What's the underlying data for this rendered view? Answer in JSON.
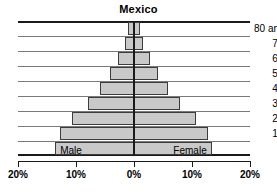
{
  "chart_data": {
    "type": "bar",
    "title": "Mexico",
    "subtitle": "",
    "xlabel": "",
    "ylabel": "",
    "orientation": "population-pyramid",
    "grid": true,
    "legend_position": "in-bars",
    "xlim": [
      -20,
      20
    ],
    "xticks": [
      -20,
      -10,
      0,
      10,
      20
    ],
    "xtick_labels": [
      "20%",
      "10%",
      "0%",
      "10%",
      "20%"
    ],
    "categories": [
      "80 and older",
      "70–79",
      "60–69",
      "50–59",
      "40–49",
      "30–39",
      "20–29",
      "10–19",
      "0–9"
    ],
    "series": [
      {
        "name": "Male",
        "side": "left",
        "values": [
          1.0,
          1.5,
          2.8,
          4.2,
          5.8,
          8.0,
          10.7,
          12.8,
          13.6
        ]
      },
      {
        "name": "Female",
        "side": "right",
        "values": [
          1.0,
          1.5,
          2.8,
          4.2,
          5.8,
          8.0,
          10.7,
          12.8,
          13.4
        ]
      }
    ],
    "bar_fill_color": "#c9c9c9",
    "bar_edge_color": "#3c3c3c",
    "gridline_color": "#7a7a7a",
    "axis_color": "#1a1a1a",
    "background_color": "#ffffff"
  },
  "labels": {
    "male": "Male",
    "female": "Female"
  }
}
